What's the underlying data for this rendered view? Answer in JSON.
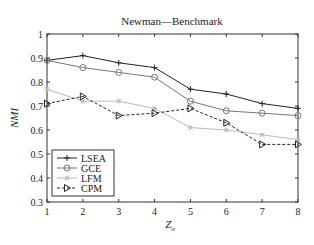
{
  "chart_data": {
    "type": "line",
    "title": "Newman—Benchmark",
    "xlabel": "Z_o",
    "xlabel_main": "Z",
    "xlabel_sub": "o",
    "ylabel": "NMI",
    "x": [
      1,
      2,
      3,
      4,
      5,
      6,
      7,
      8
    ],
    "xticks": [
      "1",
      "2",
      "3",
      "4",
      "5",
      "6",
      "7",
      "8"
    ],
    "yticks": [
      "0.3",
      "0.4",
      "0.5",
      "0.6",
      "0.7",
      "0.8",
      "0.9",
      "1"
    ],
    "xlim": [
      1,
      8
    ],
    "ylim": [
      0.3,
      1.0
    ],
    "grid": false,
    "legend_position": "lower left",
    "series": [
      {
        "name": "LSEA",
        "marker": "plus",
        "line": "solid",
        "color": "#222222",
        "values": [
          0.89,
          0.91,
          0.88,
          0.86,
          0.77,
          0.75,
          0.71,
          0.69
        ]
      },
      {
        "name": "GCE",
        "marker": "circle",
        "line": "solid",
        "color": "#777777",
        "values": [
          0.89,
          0.86,
          0.84,
          0.82,
          0.72,
          0.68,
          0.67,
          0.66
        ]
      },
      {
        "name": "LFM",
        "marker": "star",
        "line": "solid",
        "color": "#bbbbbb",
        "values": [
          0.77,
          0.72,
          0.72,
          0.69,
          0.61,
          0.6,
          0.58,
          0.56
        ]
      },
      {
        "name": "CPM",
        "marker": "triangle-right",
        "line": "dashed",
        "color": "#222222",
        "values": [
          0.71,
          0.74,
          0.66,
          0.67,
          0.69,
          0.63,
          0.54,
          0.54
        ]
      }
    ]
  }
}
